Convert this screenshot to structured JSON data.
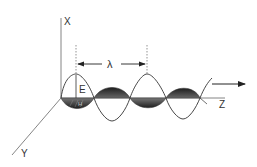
{
  "diagram": {
    "labels": {
      "x_axis": "X",
      "y_axis": "Y",
      "z_axis": "Z",
      "electric_field": "E",
      "magnetic_field": "H",
      "wavelength": "λ"
    },
    "colors": {
      "line": "#444444",
      "fill_dark": "#2a2a2a",
      "fill_mid": "#555555",
      "background": "#ffffff"
    }
  }
}
